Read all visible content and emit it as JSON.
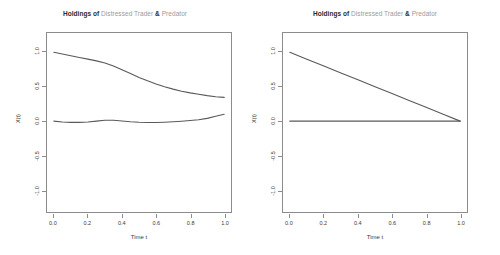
{
  "figure": {
    "panel_count": 2,
    "background": "#ffffff",
    "line_color": "#595959",
    "axis_color": "#8c8c8c",
    "title_bold_color": "#2b2b2b",
    "title_gray_color": "#9a9a9a"
  },
  "title": {
    "prefix": "Holdings of ",
    "series_a": "Distressed Trader",
    "conjunction": " & ",
    "series_b": "Predator",
    "full": "Holdings of Distressed Trader & Predator"
  },
  "axes": {
    "xlabel": "Time t",
    "ylabel": "X(t)",
    "xticks": [
      "0.0",
      "0.2",
      "0.4",
      "0.6",
      "0.8",
      "1.0"
    ],
    "xtick_values": [
      0.0,
      0.2,
      0.4,
      0.6,
      0.8,
      1.0
    ],
    "yticks": [
      "1.0",
      "0.5",
      "0.0",
      "-0.5",
      "-1.0"
    ],
    "ytick_values": [
      1.0,
      0.5,
      0.0,
      -0.5,
      -1.0
    ],
    "xlim": [
      -0.04,
      1.04
    ],
    "ylim": [
      -1.32,
      1.28
    ]
  },
  "chart_data": [
    {
      "type": "line",
      "panel": "left",
      "title": "Holdings of Distressed Trader & Predator",
      "xlabel": "Time t",
      "ylabel": "X(t)",
      "xlim": [
        -0.04,
        1.04
      ],
      "ylim": [
        -1.32,
        1.28
      ],
      "grid": false,
      "legend": "none",
      "x": [
        0.0,
        0.05,
        0.1,
        0.15,
        0.2,
        0.25,
        0.3,
        0.35,
        0.4,
        0.45,
        0.5,
        0.55,
        0.6,
        0.65,
        0.7,
        0.75,
        0.8,
        0.85,
        0.9,
        0.95,
        1.0
      ],
      "series": [
        {
          "name": "Distressed Trader",
          "values": [
            1.0,
            0.975,
            0.95,
            0.925,
            0.9,
            0.875,
            0.845,
            0.8,
            0.745,
            0.69,
            0.635,
            0.585,
            0.54,
            0.5,
            0.465,
            0.435,
            0.41,
            0.39,
            0.37,
            0.355,
            0.345
          ]
        },
        {
          "name": "Predator",
          "values": [
            0.0,
            -0.012,
            -0.018,
            -0.018,
            -0.012,
            0.0,
            0.012,
            0.012,
            0.003,
            -0.008,
            -0.016,
            -0.02,
            -0.02,
            -0.016,
            -0.01,
            -0.002,
            0.008,
            0.02,
            0.04,
            0.07,
            0.1
          ]
        }
      ]
    },
    {
      "type": "line",
      "panel": "right",
      "title": "Holdings of Distressed Trader & Predator",
      "xlabel": "Time t",
      "ylabel": "X(t)",
      "xlim": [
        -0.04,
        1.04
      ],
      "ylim": [
        -1.32,
        1.28
      ],
      "grid": false,
      "legend": "none",
      "x": [
        0.0,
        0.1,
        0.2,
        0.3,
        0.4,
        0.5,
        0.6,
        0.7,
        0.8,
        0.9,
        1.0
      ],
      "series": [
        {
          "name": "Distressed Trader",
          "values": [
            1.0,
            0.9,
            0.8,
            0.7,
            0.6,
            0.5,
            0.4,
            0.3,
            0.2,
            0.1,
            0.0
          ]
        },
        {
          "name": "Predator",
          "values": [
            0.0,
            0.0,
            0.0,
            0.0,
            0.0,
            0.0,
            0.0,
            0.0,
            0.0,
            0.0,
            0.0
          ]
        }
      ]
    }
  ]
}
